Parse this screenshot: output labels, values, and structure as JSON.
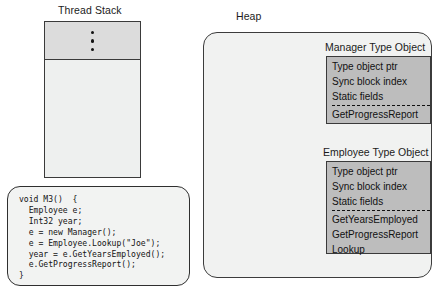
{
  "thread_stack": {
    "caption": "Thread Stack",
    "ellipsis_dots": 3
  },
  "code_block": {
    "source": "void M3()  {\n  Employee e;\n  Int32 year;\n  e = new Manager();\n  e = Employee.Lookup(\"Joe\");\n  year = e.GetYearsEmployed();\n  e.GetProgressReport();\n}"
  },
  "heap": {
    "caption": "Heap",
    "type_objects": [
      {
        "caption": "Manager Type Object",
        "header_fields": [
          "Type object ptr",
          "Sync block index",
          "Static fields"
        ],
        "methods": [
          "GetProgressReport"
        ]
      },
      {
        "caption": "Employee Type Object",
        "header_fields": [
          "Type object ptr",
          "Sync block index",
          "Static fields"
        ],
        "methods": [
          "GetYearsEmployed",
          "GetProgressReport",
          "Lookup"
        ]
      }
    ]
  },
  "colors": {
    "page_background": "#ffffff",
    "stack_frame_fill": "#dcdcdc",
    "stack_body_fill": "#eef0ef",
    "heap_fill": "#f1f2f1",
    "type_object_fill": "#bdbdbd",
    "outline": "#3a3a3a",
    "text": "#111111"
  }
}
